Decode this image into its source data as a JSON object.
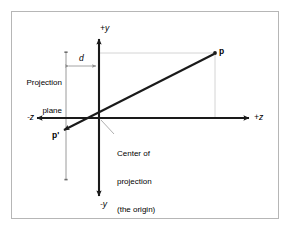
{
  "figure": {
    "type": "perspective-projection-diagram",
    "background_color": "#ffffff",
    "frame_color": "#b6b6b6",
    "stroke_color": "#1a1a1a",
    "guide_color": "#c8c8c8"
  },
  "axes": {
    "y_positive_label": "+y",
    "y_negative_label": "-y",
    "z_positive_label": "+z",
    "z_negative_label": "-z",
    "origin_x": 99,
    "origin_y": 118,
    "z_left_end": 36,
    "z_right_end": 250,
    "y_top_end": 38,
    "y_bottom_end": 197
  },
  "projection_plane": {
    "label_line1": "Projection",
    "label_line2": "plane",
    "x": 66,
    "y_top": 52,
    "y_bottom": 180
  },
  "distance": {
    "label": "d",
    "from_x": 66,
    "to_x": 99,
    "y": 66
  },
  "points": [
    {
      "name": "p",
      "label": "p",
      "x": 215,
      "y": 53,
      "bold": true
    },
    {
      "name": "p-prime",
      "label": "p'",
      "x": 66,
      "y": 131,
      "bold": true
    }
  ],
  "origin_note": {
    "line1": "Center of",
    "line2": "projection",
    "line3": "(the origin)"
  }
}
